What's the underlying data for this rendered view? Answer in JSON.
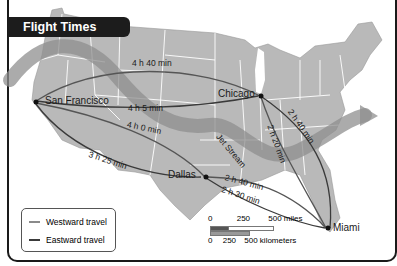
{
  "title": "Flight Times",
  "cities": {
    "san_francisco": "San Francisco",
    "chicago": "Chicago",
    "dallas": "Dallas",
    "miami": "Miami"
  },
  "routes": [
    {
      "from": "San Francisco",
      "to": "Chicago",
      "direction": "eastward",
      "time": "4 h 5 min"
    },
    {
      "from": "Chicago",
      "to": "San Francisco",
      "direction": "westward",
      "time": "4 h 40 min"
    },
    {
      "from": "San Francisco",
      "to": "Dallas",
      "direction": "eastward",
      "time": "3 h 25 min"
    },
    {
      "from": "Dallas",
      "to": "San Francisco",
      "direction": "westward",
      "time": "4 h 0 min"
    },
    {
      "from": "Chicago",
      "to": "Miami",
      "direction": "eastward",
      "time": "2 h 40 min"
    },
    {
      "from": "Miami",
      "to": "Chicago",
      "direction": "westward",
      "time": "2 h 20 min"
    },
    {
      "from": "Miami",
      "to": "Dallas",
      "direction": "westward",
      "time": "2 h 40 min"
    },
    {
      "from": "Dallas",
      "to": "Miami",
      "direction": "eastward",
      "time": "2 h 30 min"
    }
  ],
  "jet_stream_label": "Jet Stream",
  "legend": {
    "westward": "Westward travel",
    "eastward": "Eastward travel",
    "westward_color": "#8a8a8a",
    "eastward_color": "#3a3a3a"
  },
  "scale": {
    "miles": [
      "0",
      "250",
      "500 miles"
    ],
    "kilometers": [
      "0",
      "250",
      "500 kilometers"
    ]
  },
  "colors": {
    "land": "#b9b9b9",
    "state_lines": "#ffffff",
    "jet_stream": "#8f8f8f",
    "title_bg": "#1c1c1c"
  }
}
